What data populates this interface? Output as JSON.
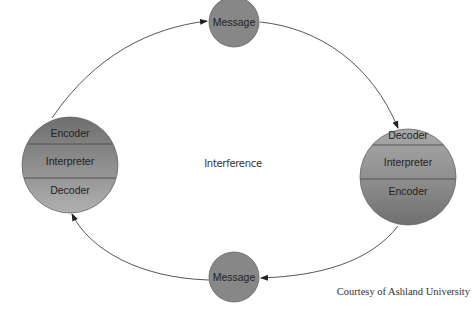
{
  "diagram": {
    "left_node": {
      "sections": [
        "Encoder",
        "Interpreter",
        "Decoder"
      ]
    },
    "right_node": {
      "sections": [
        "Decoder",
        "Interpreter",
        "Encoder"
      ]
    },
    "top_node": {
      "label": "Message"
    },
    "bottom_node": {
      "label": "Message"
    },
    "center_label": "Interference",
    "credit": "Courtesy of Ashland University",
    "colors": {
      "dark_section": "#7a7a7a",
      "mid_section": "#8f8f8f",
      "light_section": "#a6a6a6",
      "message_fill": "#8a8a8a",
      "stroke": "#555555",
      "arrow": "#333333"
    }
  }
}
